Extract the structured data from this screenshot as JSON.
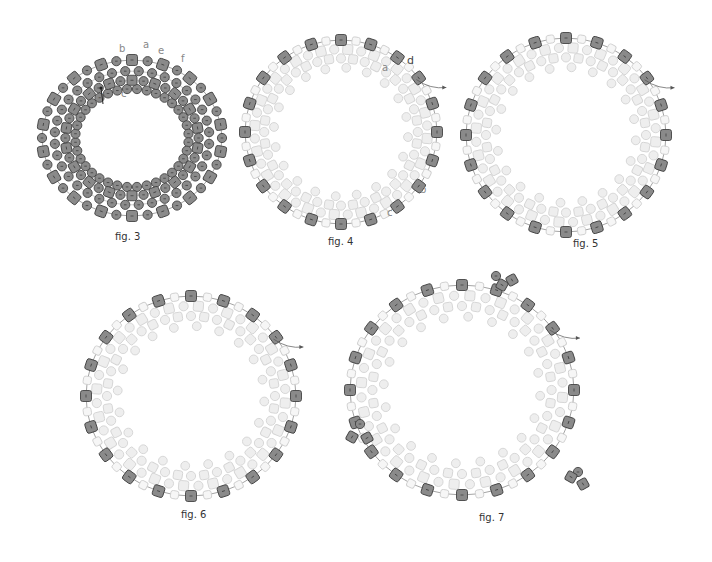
{
  "figures": [
    {
      "id": "fig3",
      "caption": "fig. 3",
      "center": [
        132,
        138
      ],
      "radii": [
        90,
        78
      ],
      "labels": [
        {
          "text": "b",
          "x": 119,
          "y": 52
        },
        {
          "text": "a",
          "x": 143,
          "y": 48
        },
        {
          "text": "e",
          "x": 158,
          "y": 54
        },
        {
          "text": "f",
          "x": 181,
          "y": 62
        },
        {
          "text": "c",
          "x": 121,
          "y": 97
        },
        {
          "text": "d",
          "x": 97,
          "y": 101
        }
      ],
      "style": "all-dark"
    },
    {
      "id": "fig4",
      "caption": "fig. 4",
      "center": [
        341,
        132
      ],
      "radii": [
        96,
        92
      ],
      "labels": [
        {
          "text": "d",
          "x": 407,
          "y": 64
        },
        {
          "text": "a",
          "x": 382,
          "y": 71
        },
        {
          "text": "b",
          "x": 420,
          "y": 193
        },
        {
          "text": "c",
          "x": 387,
          "y": 216
        }
      ],
      "style": "outer-dark"
    },
    {
      "id": "fig5",
      "caption": "fig. 5",
      "center": [
        566,
        135
      ],
      "radii": [
        100,
        97
      ],
      "labels": [],
      "style": "outer-dark"
    },
    {
      "id": "fig6",
      "caption": "fig. 6",
      "center": [
        191,
        396
      ],
      "radii": [
        105,
        100
      ],
      "labels": [],
      "style": "outer-dark"
    },
    {
      "id": "fig7",
      "caption": "fig. 7",
      "center": [
        462,
        390
      ],
      "radii": [
        112,
        105
      ],
      "labels": [],
      "style": "outer-dark"
    }
  ],
  "captions": {
    "fig3": "fig. 3",
    "fig4": "fig. 4",
    "fig5": "fig. 5",
    "fig6": "fig. 6",
    "fig7": "fig. 7"
  },
  "colors": {
    "dark_bead": "#8a8a8a",
    "dark_stroke": "#444444",
    "light_bead": "#eeeeee",
    "light_stroke": "#d4d4d4",
    "thread": "#666666"
  }
}
